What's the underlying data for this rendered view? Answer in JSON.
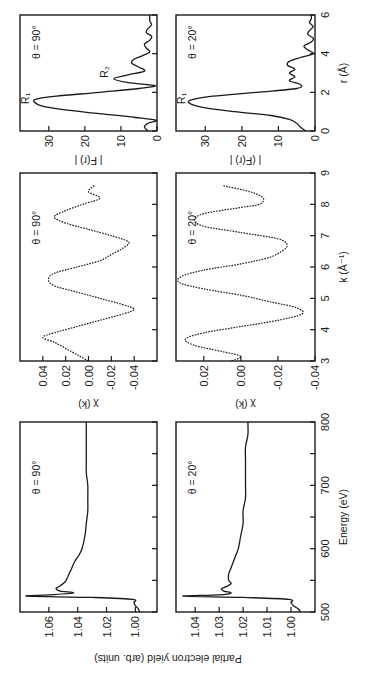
{
  "chart_data": [
    {
      "id": "energy_theta90",
      "type": "line",
      "title": "",
      "annotation": "θ = 90°",
      "xlabel": "Energy (eV)",
      "ylabel": "Partial electron yield (arb. units)",
      "xlim": [
        500,
        800
      ],
      "ylim": [
        0.985,
        1.08
      ],
      "xticks": [
        500,
        550,
        600,
        650,
        700,
        750,
        800
      ],
      "xtick_labels": [
        "500",
        "",
        "600",
        "",
        "700",
        "",
        "800"
      ],
      "yticks": [
        1.0,
        1.02,
        1.04,
        1.06
      ],
      "ytick_labels": [
        "1.00",
        "1.02",
        "1.04",
        "1.06"
      ],
      "grid": false,
      "x": [
        500,
        505,
        510,
        515,
        520,
        523,
        525,
        527,
        530,
        533,
        537,
        540,
        545,
        550,
        555,
        560,
        570,
        580,
        590,
        600,
        620,
        640,
        660,
        680,
        700,
        720,
        740,
        760,
        780,
        800
      ],
      "values": [
        0.997,
        0.998,
        1.0,
        1.001,
        1.002,
        1.03,
        1.075,
        1.06,
        1.043,
        1.052,
        1.055,
        1.053,
        1.05,
        1.048,
        1.047,
        1.046,
        1.044,
        1.042,
        1.039,
        1.037,
        1.035,
        1.034,
        1.033,
        1.033,
        1.033,
        1.034,
        1.034,
        1.034,
        1.034,
        1.034
      ]
    },
    {
      "id": "energy_theta20",
      "type": "line",
      "title": "",
      "annotation": "θ = 20°",
      "xlabel": "Energy (eV)",
      "ylabel": "Partial electron yield (arb. units)",
      "xlim": [
        500,
        800
      ],
      "ylim": [
        0.99,
        1.048
      ],
      "xticks": [
        500,
        550,
        600,
        650,
        700,
        750,
        800
      ],
      "xtick_labels": [
        "500",
        "",
        "600",
        "",
        "700",
        "",
        "800"
      ],
      "yticks": [
        1.0,
        1.01,
        1.02,
        1.03,
        1.04
      ],
      "ytick_labels": [
        "1.00",
        "1.01",
        "1.02",
        "1.03",
        "1.04"
      ],
      "grid": false,
      "x": [
        500,
        505,
        510,
        515,
        520,
        523,
        525,
        527,
        530,
        533,
        537,
        540,
        545,
        550,
        560,
        570,
        580,
        590,
        600,
        620,
        640,
        660,
        680,
        700,
        720,
        740,
        760,
        780,
        800
      ],
      "values": [
        0.996,
        0.997,
        0.999,
        1.0,
        1.001,
        1.02,
        1.045,
        1.03,
        1.025,
        1.028,
        1.029,
        1.027,
        1.025,
        1.026,
        1.026,
        1.025,
        1.024,
        1.023,
        1.022,
        1.021,
        1.02,
        1.02,
        1.019,
        1.019,
        1.019,
        1.019,
        1.019,
        1.018,
        1.018
      ]
    },
    {
      "id": "chi_theta90",
      "type": "line",
      "title": "",
      "annotation": "θ = 90°",
      "xlabel": "k (Å⁻¹)",
      "ylabel": "χ (k)",
      "xlim": [
        3,
        9
      ],
      "ylim": [
        -0.06,
        0.06
      ],
      "xticks": [
        3,
        4,
        5,
        6,
        7,
        8,
        9
      ],
      "xtick_labels": [
        "3",
        "4",
        "5",
        "6",
        "7",
        "8",
        "9"
      ],
      "yticks": [
        -0.04,
        -0.02,
        0.0,
        0.02,
        0.04
      ],
      "ytick_labels": [
        "-0.04",
        "-0.02",
        "0.00",
        "0.02",
        "0.04"
      ],
      "grid": false,
      "x": [
        3.0,
        3.2,
        3.4,
        3.6,
        3.75,
        3.9,
        4.1,
        4.3,
        4.5,
        4.65,
        4.8,
        5.0,
        5.2,
        5.4,
        5.6,
        5.8,
        6.0,
        6.2,
        6.4,
        6.6,
        6.8,
        7.0,
        7.2,
        7.4,
        7.6,
        7.8,
        8.0,
        8.2,
        8.4,
        8.6
      ],
      "values": [
        0.0,
        0.01,
        0.02,
        0.03,
        0.04,
        0.03,
        0.01,
        -0.01,
        -0.03,
        -0.04,
        -0.03,
        -0.01,
        0.01,
        0.03,
        0.035,
        0.03,
        0.01,
        -0.01,
        -0.02,
        -0.03,
        -0.035,
        -0.02,
        0.0,
        0.02,
        0.03,
        0.02,
        0.005,
        -0.01,
        0.0,
        -0.005
      ]
    },
    {
      "id": "chi_theta20",
      "type": "line",
      "title": "",
      "annotation": "θ = 20°",
      "xlabel": "k (Å⁻¹)",
      "ylabel": "χ (k)",
      "xlim": [
        3,
        9
      ],
      "ylim": [
        -0.04,
        0.035
      ],
      "xticks": [
        3,
        4,
        5,
        6,
        7,
        8,
        9
      ],
      "xtick_labels": [
        "3",
        "4",
        "5",
        "6",
        "7",
        "8",
        "9"
      ],
      "yticks": [
        -0.04,
        -0.02,
        0.0,
        0.02
      ],
      "ytick_labels": [
        "-0.04",
        "-0.02",
        "0.00",
        "0.02"
      ],
      "grid": false,
      "x": [
        3.0,
        3.15,
        3.3,
        3.5,
        3.7,
        3.9,
        4.1,
        4.3,
        4.5,
        4.7,
        4.9,
        5.1,
        5.3,
        5.5,
        5.7,
        5.9,
        6.1,
        6.3,
        6.5,
        6.7,
        6.9,
        7.1,
        7.3,
        7.5,
        7.7,
        7.9,
        8.0,
        8.2,
        8.4,
        8.6
      ],
      "values": [
        0.005,
        0.0,
        0.01,
        0.025,
        0.03,
        0.02,
        0.0,
        -0.02,
        -0.033,
        -0.03,
        -0.015,
        0.0,
        0.02,
        0.033,
        0.032,
        0.02,
        0.0,
        -0.015,
        -0.022,
        -0.025,
        -0.02,
        0.0,
        0.02,
        0.025,
        0.02,
        0.0,
        -0.01,
        -0.012,
        -0.005,
        0.01
      ]
    },
    {
      "id": "fr_theta90",
      "type": "line",
      "title": "",
      "annotation": "θ = 90°",
      "peak_labels": [
        "R₁",
        "R₂"
      ],
      "xlabel": "r (Å)",
      "ylabel": "| F(r) |",
      "xlim": [
        0,
        6
      ],
      "ylim": [
        0,
        38
      ],
      "xticks": [
        0,
        2,
        4,
        6
      ],
      "xtick_labels": [
        "0",
        "2",
        "4",
        "6"
      ],
      "yticks": [
        0,
        10,
        20,
        30
      ],
      "ytick_labels": [
        "0",
        "10",
        "20",
        "30"
      ],
      "grid": false,
      "x": [
        0,
        0.2,
        0.4,
        0.55,
        0.7,
        0.9,
        1.1,
        1.3,
        1.5,
        1.65,
        1.8,
        2.0,
        2.2,
        2.35,
        2.5,
        2.7,
        2.9,
        3.1,
        3.3,
        3.5,
        3.7,
        3.9,
        4.1,
        4.3,
        4.5,
        4.7,
        4.9,
        5.1,
        5.3,
        5.5,
        5.7,
        6.0
      ],
      "values": [
        2.5,
        3.5,
        2.5,
        0.2,
        6,
        16,
        26,
        32,
        34,
        33.5,
        28,
        16,
        5,
        0.5,
        8,
        12,
        8,
        3.5,
        5,
        7,
        6.5,
        4,
        2,
        3,
        3.5,
        2,
        1.5,
        3,
        2.5,
        1.5,
        2,
        2
      ]
    },
    {
      "id": "fr_theta20",
      "type": "line",
      "title": "",
      "annotation": "θ = 20°",
      "peak_labels": [
        "R₁"
      ],
      "xlabel": "r (Å)",
      "ylabel": "| (F(r) |",
      "xlim": [
        0,
        6
      ],
      "ylim": [
        0,
        38
      ],
      "xticks": [
        0,
        2,
        4,
        6
      ],
      "xtick_labels": [
        "0",
        "2",
        "4",
        "6"
      ],
      "yticks": [
        0,
        10,
        20,
        30
      ],
      "ytick_labels": [
        "0",
        "10",
        "20",
        "30"
      ],
      "grid": false,
      "x": [
        0,
        0.2,
        0.4,
        0.6,
        0.8,
        1.0,
        1.2,
        1.4,
        1.6,
        1.8,
        2.0,
        2.2,
        2.4,
        2.6,
        2.8,
        3.0,
        3.2,
        3.4,
        3.6,
        3.8,
        4.0,
        4.2,
        4.4,
        4.6,
        4.8,
        5.0,
        5.2,
        5.4,
        5.6,
        5.8,
        6.0
      ],
      "values": [
        2.5,
        4,
        5,
        7,
        12,
        22,
        30,
        34,
        34,
        28,
        16,
        5,
        4,
        7,
        5.5,
        7,
        5.5,
        7.5,
        7,
        4,
        0.5,
        2,
        3,
        1,
        0.5,
        2,
        1.5,
        0.5,
        1.5,
        1,
        1
      ]
    }
  ],
  "figure": {
    "orientation": "rotated 90° counter-clockwise",
    "panels": {
      "energy_top_annotation": "θ = 90°",
      "energy_bottom_annotation": "θ = 20°",
      "chi_top_annotation": "θ = 90°",
      "chi_bottom_annotation": "θ = 20°",
      "fr_top_annotation": "θ = 90°",
      "fr_bottom_annotation": "θ = 20°"
    },
    "labels": {
      "energy_x": "Energy (eV)",
      "energy_y": "Partial electron yield (arb. units)",
      "chi_x": "k (Å⁻¹)",
      "chi_y_top": "χ (k)",
      "chi_y_bottom": "χ (k)",
      "fr_x": "r (Å)",
      "fr_y_top": "| F(r) |",
      "fr_y_bottom": "| (F(r) |",
      "peak_r1_top": "R₁",
      "peak_r2_top": "R₂",
      "peak_r1_bottom": "R₁"
    }
  }
}
